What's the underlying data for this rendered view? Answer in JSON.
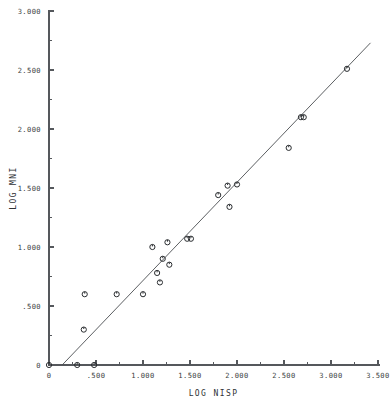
{
  "chart_data": {
    "type": "scatter",
    "title": "",
    "xlabel": "LOG NISP",
    "ylabel": "LOG MNI",
    "xlim": [
      0,
      3.5
    ],
    "ylim": [
      0,
      3.0
    ],
    "grid": false,
    "legend": "none",
    "xticks": [
      "0",
      ".500",
      "1.000",
      "1.500",
      "2.000",
      "2.500",
      "3.000",
      "3.500"
    ],
    "xtick_values": [
      0,
      0.5,
      1.0,
      1.5,
      2.0,
      2.5,
      3.0,
      3.5
    ],
    "yticks": [
      "0",
      ".500",
      "1.000",
      "1.500",
      "2.000",
      "2.500",
      "3.000"
    ],
    "ytick_values": [
      0,
      0.5,
      1.0,
      1.5,
      2.0,
      2.5,
      3.0
    ],
    "minor_tick_step_x": 0.25,
    "minor_tick_step_y": 0.25,
    "marker": "open-circle",
    "points": [
      {
        "x": 0.0,
        "y": 0.0
      },
      {
        "x": 0.3,
        "y": 0.0
      },
      {
        "x": 0.48,
        "y": 0.0
      },
      {
        "x": 0.38,
        "y": 0.6
      },
      {
        "x": 0.37,
        "y": 0.3
      },
      {
        "x": 0.72,
        "y": 0.6
      },
      {
        "x": 1.0,
        "y": 0.6
      },
      {
        "x": 1.1,
        "y": 1.0
      },
      {
        "x": 1.15,
        "y": 0.78
      },
      {
        "x": 1.18,
        "y": 0.7
      },
      {
        "x": 1.21,
        "y": 0.9
      },
      {
        "x": 1.26,
        "y": 1.04
      },
      {
        "x": 1.28,
        "y": 0.85
      },
      {
        "x": 1.47,
        "y": 1.07
      },
      {
        "x": 1.51,
        "y": 1.07
      },
      {
        "x": 1.8,
        "y": 1.44
      },
      {
        "x": 1.9,
        "y": 1.52
      },
      {
        "x": 1.92,
        "y": 1.34
      },
      {
        "x": 2.0,
        "y": 1.53
      },
      {
        "x": 2.55,
        "y": 1.84
      },
      {
        "x": 2.68,
        "y": 2.1
      },
      {
        "x": 2.71,
        "y": 2.1
      },
      {
        "x": 3.17,
        "y": 2.51
      }
    ],
    "fit_line": {
      "x_start": 0.14,
      "y_start": 0.0,
      "x_end": 3.42,
      "y_end": 2.73
    }
  },
  "colors": {
    "background": "#ffffff",
    "axis": "#55585c",
    "marker_stroke": "#2a2d30",
    "fit_line": "#4a4d50",
    "text": "#3a3d40"
  }
}
